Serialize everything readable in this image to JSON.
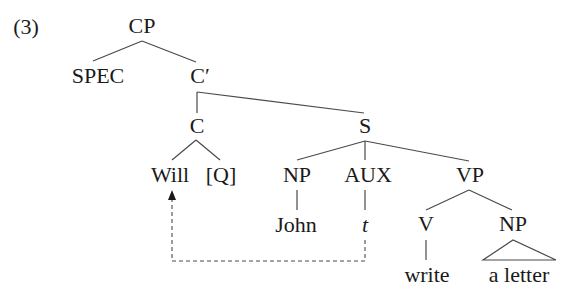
{
  "example_number": "(3)",
  "colors": {
    "line": "#4a4a4a",
    "text": "#1a1a1a",
    "background": "#ffffff"
  },
  "tree": {
    "nodes": {
      "cp": "CP",
      "spec": "SPEC",
      "c_bar": "C′",
      "c": "C",
      "s": "S",
      "will": "Will",
      "q": "[Q]",
      "np_subj": "NP",
      "aux": "AUX",
      "vp": "VP",
      "john": "John",
      "trace": "t",
      "v": "V",
      "np_obj": "NP",
      "write": "write",
      "a_letter": "a letter"
    },
    "movement": {
      "from": "t",
      "to": "Will",
      "style": "dashed-arrow"
    }
  }
}
